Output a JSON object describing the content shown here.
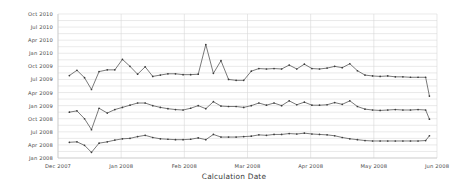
{
  "chart_data": {
    "type": "line",
    "title": "",
    "subtitle": "",
    "xlabel": "Calculation Date",
    "ylabel": "",
    "grid": true,
    "legend_position": "none",
    "marker": "dot",
    "line_color": "#4d4d4d",
    "marker_color": "#3c3c3c",
    "grid_color": "#dcdcdc",
    "background_color": "#ffffff",
    "x_type": "date",
    "y_type": "date",
    "xlim": [
      "Dec 2007",
      "Jun 2008"
    ],
    "ylim": [
      "Jan 2008",
      "Oct 2010"
    ],
    "xticks": [
      "Dec 2007",
      "Jan 2008",
      "Feb 2008",
      "Mar 2008",
      "Apr 2008",
      "May 2008",
      "Jun 2008"
    ],
    "yticks": [
      "Jan 2008",
      "Apr 2008",
      "Jul 2008",
      "Oct 2008",
      "Jan 2009",
      "Apr 2009",
      "Jul 2009",
      "Oct 2009",
      "Jan 2010",
      "Apr 2010",
      "Jul 2010",
      "Oct 2010"
    ],
    "y_tick_months": [
      0,
      3,
      6,
      9,
      12,
      15,
      18,
      21,
      24,
      27,
      30,
      33
    ],
    "x_tick_months": [
      0,
      1,
      2,
      3,
      4,
      5,
      6
    ],
    "series": [
      {
        "name": "Upper series",
        "x": [
          0.18,
          0.3,
          0.42,
          0.53,
          0.65,
          0.78,
          0.9,
          1.02,
          1.14,
          1.26,
          1.38,
          1.5,
          1.62,
          1.74,
          1.86,
          1.98,
          2.1,
          2.22,
          2.34,
          2.46,
          2.58,
          2.7,
          2.82,
          2.94,
          3.06,
          3.18,
          3.3,
          3.42,
          3.54,
          3.66,
          3.78,
          3.9,
          4.02,
          4.14,
          4.26,
          4.38,
          4.5,
          4.62,
          4.74,
          4.86,
          4.98,
          5.1,
          5.22,
          5.34,
          5.46,
          5.58,
          5.7,
          5.82,
          5.88
        ],
        "y": [
          18.9,
          20.1,
          18.4,
          15.7,
          19.8,
          20.2,
          20.2,
          22.6,
          21.0,
          19.2,
          20.9,
          18.7,
          19.0,
          19.3,
          19.3,
          19.1,
          19.1,
          19.2,
          26.0,
          19.4,
          22.3,
          18.0,
          17.8,
          17.8,
          19.9,
          20.5,
          20.4,
          20.5,
          20.4,
          21.3,
          20.4,
          21.5,
          20.5,
          20.4,
          20.6,
          21.0,
          20.7,
          21.6,
          20.0,
          19.0,
          18.8,
          18.7,
          18.8,
          18.6,
          18.6,
          18.5,
          18.5,
          18.5,
          14.2
        ]
      },
      {
        "name": "Middle series",
        "x": [
          0.18,
          0.3,
          0.42,
          0.53,
          0.65,
          0.78,
          0.9,
          1.02,
          1.14,
          1.26,
          1.38,
          1.5,
          1.62,
          1.74,
          1.86,
          1.98,
          2.1,
          2.22,
          2.34,
          2.46,
          2.58,
          2.7,
          2.82,
          2.94,
          3.06,
          3.18,
          3.3,
          3.42,
          3.54,
          3.66,
          3.78,
          3.9,
          4.02,
          4.14,
          4.26,
          4.38,
          4.5,
          4.62,
          4.74,
          4.86,
          4.98,
          5.1,
          5.22,
          5.34,
          5.46,
          5.58,
          5.7,
          5.82,
          5.88
        ],
        "y": [
          10.5,
          10.8,
          9.0,
          6.5,
          11.4,
          10.3,
          11.1,
          11.6,
          12.1,
          12.6,
          12.6,
          12.0,
          11.6,
          11.3,
          11.1,
          11.0,
          11.4,
          12.0,
          11.3,
          12.9,
          11.9,
          11.8,
          11.8,
          11.6,
          12.0,
          12.6,
          12.1,
          12.6,
          12.0,
          13.1,
          12.2,
          12.8,
          12.1,
          12.1,
          12.2,
          12.7,
          12.3,
          13.1,
          11.8,
          11.2,
          11.0,
          10.9,
          11.0,
          11.1,
          11.0,
          11.0,
          11.1,
          11.0,
          8.9
        ]
      },
      {
        "name": "Lower series",
        "x": [
          0.18,
          0.3,
          0.42,
          0.53,
          0.65,
          0.78,
          0.9,
          1.02,
          1.14,
          1.26,
          1.38,
          1.5,
          1.62,
          1.74,
          1.86,
          1.98,
          2.1,
          2.22,
          2.34,
          2.46,
          2.58,
          2.7,
          2.82,
          2.94,
          3.06,
          3.18,
          3.3,
          3.42,
          3.54,
          3.66,
          3.78,
          3.9,
          4.02,
          4.14,
          4.26,
          4.38,
          4.5,
          4.62,
          4.74,
          4.86,
          4.98,
          5.1,
          5.22,
          5.34,
          5.46,
          5.58,
          5.7,
          5.82,
          5.88
        ],
        "y": [
          3.6,
          3.7,
          2.9,
          1.3,
          3.4,
          3.7,
          4.1,
          4.4,
          4.5,
          4.9,
          5.2,
          4.7,
          4.4,
          4.3,
          4.2,
          4.2,
          4.3,
          4.6,
          4.2,
          5.4,
          4.8,
          4.8,
          4.8,
          4.9,
          5.0,
          5.3,
          5.2,
          5.4,
          5.4,
          5.6,
          5.5,
          5.7,
          5.5,
          5.4,
          5.3,
          5.1,
          4.7,
          4.4,
          4.2,
          4.0,
          3.9,
          3.9,
          3.9,
          3.9,
          3.9,
          3.9,
          3.9,
          4.0,
          5.1
        ]
      }
    ]
  }
}
